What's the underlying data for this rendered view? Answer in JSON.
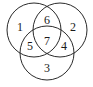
{
  "diagram": {
    "type": "venn",
    "circles": [
      {
        "id": "A",
        "cx": 34,
        "cy": 30,
        "r": 27
      },
      {
        "id": "B",
        "cx": 60,
        "cy": 30,
        "r": 27
      },
      {
        "id": "C",
        "cx": 47,
        "cy": 53,
        "r": 27
      }
    ],
    "regions": [
      {
        "label": "1",
        "x": 20,
        "y": 27
      },
      {
        "label": "6",
        "x": 47,
        "y": 20
      },
      {
        "label": "2",
        "x": 73,
        "y": 27
      },
      {
        "label": "5",
        "x": 30,
        "y": 46
      },
      {
        "label": "7",
        "x": 47,
        "y": 41
      },
      {
        "label": "4",
        "x": 64,
        "y": 46
      },
      {
        "label": "3",
        "x": 47,
        "y": 68
      }
    ],
    "stroke_color": "#2a2a2a",
    "background": "#ffffff"
  }
}
